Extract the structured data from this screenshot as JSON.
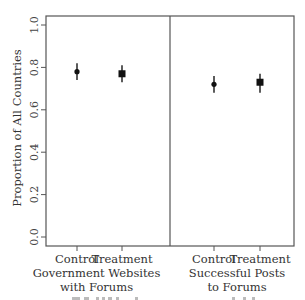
{
  "chart_data": {
    "type": "scatter",
    "subtype": "point-estimate-with-error-bars",
    "ylabel": "Proportion of All Countries",
    "ylim": [
      0.0,
      1.0
    ],
    "yticks": [
      "0.0",
      "0.2",
      "0.4",
      "0.6",
      "0.8",
      "1.0"
    ],
    "grid": false,
    "legend": null,
    "panels": [
      {
        "title": "Government Websites with Forums",
        "title_lines": [
          "Government Websites",
          "with Forums"
        ],
        "categories": [
          "Control",
          "Treatment"
        ],
        "values": [
          0.78,
          0.77
        ],
        "lower": [
          0.74,
          0.73
        ],
        "upper": [
          0.82,
          0.81
        ],
        "markers": [
          "dot",
          "square"
        ]
      },
      {
        "title": "Successful Posts to Forums",
        "title_lines": [
          "Successful Posts",
          "to Forums"
        ],
        "categories": [
          "Control",
          "Treatment"
        ],
        "values": [
          0.72,
          0.73
        ],
        "lower": [
          0.68,
          0.68
        ],
        "upper": [
          0.76,
          0.77
        ],
        "markers": [
          "dot",
          "square"
        ]
      }
    ]
  }
}
